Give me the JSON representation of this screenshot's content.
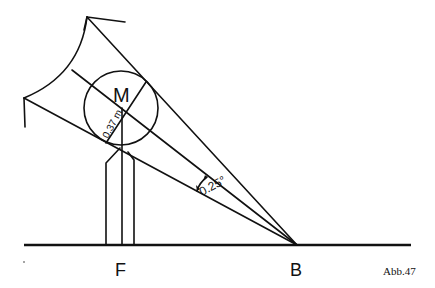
{
  "figure": {
    "caption": "Abb.47",
    "labels": {
      "center": "M",
      "foot": "F",
      "base": "B",
      "radius": "0.37 m",
      "angle": "0.25°"
    },
    "colors": {
      "ink": "#111111",
      "background": "#ffffff"
    }
  }
}
